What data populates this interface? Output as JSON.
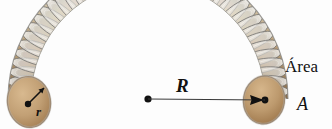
{
  "figure": {
    "background_color": "#fdfdfd"
  },
  "labels": {
    "radius_major": "R",
    "radius_minor": "r",
    "area_word": "Área",
    "area_symbol": "A"
  },
  "colors": {
    "core_fill": "#c19a6b",
    "core_fill_dark": "#a97f55",
    "core_edge": "#8a6642",
    "winding_light": "#e8e6e0",
    "winding_mid": "#b9b8b4",
    "winding_dark": "#7e7d7b",
    "line_color": "#3a3a3a",
    "text_color": "#111111"
  },
  "geometry": {
    "arc_center_x": 148,
    "arc_center_y": 99,
    "major_radius_px": 117,
    "tube_radius_px": 23,
    "turn_count": 44,
    "arc_start_deg": 180,
    "arc_end_deg": 0
  },
  "annotations": {
    "R_line_from": "center-dot",
    "R_line_to": "right-end-center",
    "r_arrow_from": "left-end-center",
    "r_arrow_direction": "up-right"
  }
}
